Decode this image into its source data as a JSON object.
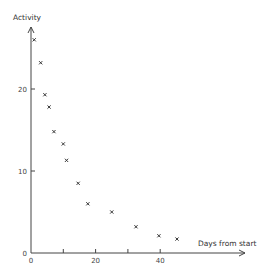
{
  "chart_data": {
    "type": "scatter",
    "title": "",
    "xlabel": "Days from start",
    "ylabel": "Activity",
    "xlim": [
      0,
      66
    ],
    "ylim": [
      0,
      27.5
    ],
    "grid": false,
    "legend": null,
    "marker": "x",
    "x_ticks": [
      0,
      10,
      20,
      30,
      40
    ],
    "x_tick_labels": [
      "0",
      "",
      "20",
      "",
      "40"
    ],
    "y_ticks": [
      0,
      10,
      20
    ],
    "y_tick_labels": [
      "0",
      "10",
      "20"
    ],
    "series": [
      {
        "name": "Activity",
        "x": [
          1,
          3,
          4.3,
          5.6,
          7.1,
          10,
          11,
          14.6,
          17.6,
          25,
          32.5,
          39.6,
          45.2
        ],
        "y": [
          26.0,
          23.2,
          19.3,
          17.8,
          14.8,
          13.3,
          11.3,
          8.5,
          6.0,
          5.0,
          3.2,
          2.1,
          1.7
        ]
      }
    ]
  },
  "plot": {
    "origin_px": [
      31,
      253
    ],
    "px_per_x": 3.23,
    "px_per_y": 8.2,
    "x_axis_end_px": 245,
    "y_axis_top_px": 27
  }
}
